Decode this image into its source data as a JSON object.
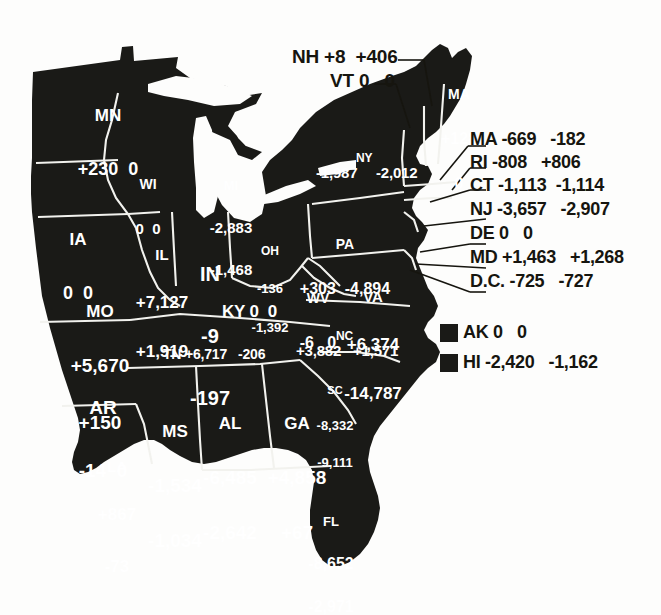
{
  "figure": {
    "type": "choropleth-annotated-map",
    "region": "Eastern United States",
    "land_color": "#1a1a17",
    "border_color": "#ffffff",
    "background_color": "#fdfdfc",
    "label_color_on_land": "#ffffff",
    "label_color_on_background": "#16150f"
  },
  "states": [
    {
      "abbr": "MN",
      "v1": "+230",
      "v2": "0"
    },
    {
      "abbr": "WI",
      "v1": "0",
      "v2": "0"
    },
    {
      "abbr": "MI",
      "v1": "-2,883",
      "v2": "-1,468"
    },
    {
      "abbr": "IA",
      "v1": "0",
      "v2": "0"
    },
    {
      "abbr": "IL",
      "v1": "+7,127",
      "v2": "+1,919"
    },
    {
      "abbr": "IN",
      "v1": "-9",
      "v2": "-197"
    },
    {
      "abbr": "OH",
      "v1": "-136",
      "v2": "-1,392"
    },
    {
      "abbr": "MO",
      "v1": "+5,670",
      "v2": "+150"
    },
    {
      "abbr": "KY",
      "v1": "0",
      "v2": "0"
    },
    {
      "abbr": "WV",
      "v1": "-6",
      "v2": "0"
    },
    {
      "abbr": "VA",
      "v1": "+6,374",
      "v2": "-14,787"
    },
    {
      "abbr": "PA",
      "v1": "+303",
      "v2": "-4,894"
    },
    {
      "abbr": "NY",
      "v1": "-1,987",
      "v2": "-2,012"
    },
    {
      "abbr": "MA",
      "v1": "+128",
      "v2": "0"
    },
    {
      "abbr": "NC",
      "v1": "+3,882",
      "v2": "+1,571"
    },
    {
      "abbr": "SC",
      "v1": "-8,332",
      "v2": "-9,111"
    },
    {
      "abbr": "TN",
      "v1": "+6,717",
      "v2": "-206"
    },
    {
      "abbr": "AR",
      "v1": "-14",
      "v2": "0"
    },
    {
      "abbr": "MS",
      "v1": "-1,534",
      "v2": "-1,034"
    },
    {
      "abbr": "AL",
      "v1": "-6,485",
      "v2": "-2,642"
    },
    {
      "abbr": "GA",
      "v1": "+4,858",
      "v2": "+67"
    },
    {
      "abbr": "LA",
      "v1": "+867",
      "v2": "-73"
    },
    {
      "abbr": "FL",
      "v1": "-8,652",
      "v2": "-2,971"
    }
  ],
  "top_labels": [
    {
      "abbr": "NH",
      "v1": "+8",
      "v2": "+406",
      "text": "NH +8  +406"
    },
    {
      "abbr": "VT",
      "v1": "0",
      "v2": "0",
      "text": "VT 0   0"
    }
  ],
  "callouts": [
    {
      "abbr": "MA",
      "v1": "-669",
      "v2": "-182",
      "text": "MA -669   -182"
    },
    {
      "abbr": "RI",
      "v1": "-808",
      "v2": "+806",
      "text": "RI -808   +806"
    },
    {
      "abbr": "CT",
      "v1": "-1,113",
      "v2": "-1,114",
      "text": "CT -1,113  -1,114"
    },
    {
      "abbr": "NJ",
      "v1": "-3,657",
      "v2": "-2,907",
      "text": "NJ -3,657   -2,907"
    },
    {
      "abbr": "DE",
      "v1": "0",
      "v2": "0",
      "text": "DE 0   0"
    },
    {
      "abbr": "MD",
      "v1": "+1,463",
      "v2": "+1,268",
      "text": "MD +1,463   +1,268"
    },
    {
      "abbr": "D.C.",
      "v1": "-725",
      "v2": "-727",
      "text": "D.C. -725   -727"
    }
  ],
  "legend": [
    {
      "abbr": "AK",
      "v1": "0",
      "v2": "0",
      "text": "AK 0   0"
    },
    {
      "abbr": "HI",
      "v1": "-2,420",
      "v2": "-1,162",
      "text": "HI -2,420   -1,162"
    }
  ],
  "state_text": {
    "MN_abbr": "MN",
    "MN_vals": "+230  0",
    "WI_abbr": "WI",
    "WI_vals": "0  0",
    "MI_abbr": "MI",
    "MI_v1": "-2,883",
    "MI_v2": "-1,468",
    "IA_abbr": "IA",
    "IA_vals": "0  0",
    "IL_abbr": "IL",
    "IL_v1": "+7,127",
    "IL_v2": "+1,919",
    "IN_abbr": "IN",
    "IN_v1": "-9",
    "IN_v2": "-197",
    "OH_abbr": "OH",
    "OH_v1": "-136",
    "OH_v2": "-1,392",
    "MO_abbr": "MO",
    "MO_v1": "+5,670",
    "MO_v2": "+150",
    "KY_line": "KY 0  0",
    "WV_abbr": "WV",
    "WV_vals": "-6   0",
    "VA_abbr": "VA",
    "VA_v1": "+6,374",
    "VA_v2": "-14,787",
    "PA_abbr": "PA",
    "PA_vals": "+303  -4,894",
    "NY_abbr": "NY",
    "NY_v1": "-1,987",
    "NY_v2": "-2,012",
    "ME_abbr": "MA",
    "ME_v1": "+128",
    "ME_v2": "0",
    "NC_abbr": "NC",
    "NC_vals": "+3,882   +1,571",
    "SC_abbr": "SC",
    "SC_v1": "-8,332",
    "SC_v2": "-9,111",
    "TN_line": "TN +6,717   -206",
    "AR_abbr": "AR",
    "AR_vals": "-14  0",
    "MS_abbr": "MS",
    "MS_v1": "-1,534",
    "MS_v2": "-1,034",
    "AL_abbr": "AL",
    "AL_v1": "-6,485",
    "AL_v2": "-2,642",
    "GA_abbr": "GA",
    "GA_v1": "+4,858",
    "GA_v2": "+67",
    "LA_abbr": "LA",
    "LA_v1": "+867",
    "LA_v2": "-73",
    "FL_abbr": "FL",
    "FL_v1": "-8,652",
    "FL_v2": "-2,971"
  }
}
